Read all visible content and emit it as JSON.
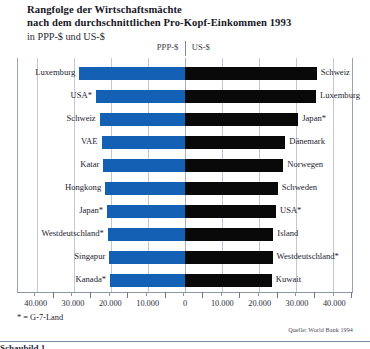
{
  "title": {
    "line1": "Rangfolge der Wirtschaftsmächte",
    "line2": "nach dem durchschnittlichen Pro-Kopf-Einkommen 1993",
    "line3": "in PPP-$ und US-$"
  },
  "legend": {
    "left_label": "PPP-$",
    "right_label": "US-$"
  },
  "footnote": "* = G-7-Land",
  "source": "Quelle: World Bank 1994",
  "clipped_caption": "Schaubild 1",
  "colors": {
    "left_bar": "#1460b4",
    "right_bar": "#090909",
    "grid": "#c2c8d2",
    "rule": "#7e8aa6"
  },
  "chart_data": {
    "type": "bar",
    "title": "Rangfolge der Wirtschaftsmächte nach dem durchschnittlichen Pro-Kopf-Einkommen 1993",
    "subtitle": "in PPP-$ und US-$",
    "orientation": "horizontal-diverging",
    "xlabel": "",
    "ylabel": "",
    "xlim": [
      -45000,
      45000
    ],
    "axis_ticks": [
      "40.000",
      "30.000",
      "20.000",
      "10.000",
      "0",
      "10.000",
      "20.000",
      "30.000",
      "40.000"
    ],
    "axis_tick_values": [
      40000,
      30000,
      20000,
      10000,
      0,
      10000,
      20000,
      30000,
      40000
    ],
    "grid": true,
    "legend_position": "top-center",
    "series": [
      {
        "name": "PPP-$",
        "side": "left",
        "color": "#1460b4",
        "categories": [
          "Luxemburg",
          "USA*",
          "Schweiz",
          "VAE",
          "Katar",
          "Hongkong",
          "Japan*",
          "Westdeutschland*",
          "Singapur",
          "Kanada*"
        ],
        "values": [
          28500,
          24000,
          23000,
          22500,
          22000,
          21500,
          21000,
          20800,
          20400,
          20200
        ]
      },
      {
        "name": "US-$",
        "side": "right",
        "color": "#090909",
        "categories": [
          "Schweiz",
          "Luxemburg",
          "Japan*",
          "Dänemark",
          "Norwegen",
          "Schweden",
          "USA*",
          "Island",
          "Westdeutschland*",
          "Kuwait"
        ],
        "values": [
          35500,
          35300,
          30500,
          27000,
          26500,
          25000,
          24500,
          23800,
          23600,
          23400
        ]
      }
    ],
    "rows": [
      {
        "left_label": "Luxemburg",
        "left_value": 28500,
        "right_label": "Schweiz",
        "right_value": 35500
      },
      {
        "left_label": "USA*",
        "left_value": 24000,
        "right_label": "Luxemburg",
        "right_value": 35300
      },
      {
        "left_label": "Schweiz",
        "left_value": 23000,
        "right_label": "Japan*",
        "right_value": 30500
      },
      {
        "left_label": "VAE",
        "left_value": 22500,
        "right_label": "Dänemark",
        "right_value": 27000
      },
      {
        "left_label": "Katar",
        "left_value": 22000,
        "right_label": "Norwegen",
        "right_value": 26500
      },
      {
        "left_label": "Hongkong",
        "left_value": 21500,
        "right_label": "Schweden",
        "right_value": 25000
      },
      {
        "left_label": "Japan*",
        "left_value": 21000,
        "right_label": "USA*",
        "right_value": 24500
      },
      {
        "left_label": "Westdeutschland*",
        "left_value": 20800,
        "right_label": "Island",
        "right_value": 23800
      },
      {
        "left_label": "Singapur",
        "left_value": 20400,
        "right_label": "Westdeutschland*",
        "right_value": 23600
      },
      {
        "left_label": "Kanada*",
        "left_value": 20200,
        "right_label": "Kuwait",
        "right_value": 23400
      }
    ]
  }
}
